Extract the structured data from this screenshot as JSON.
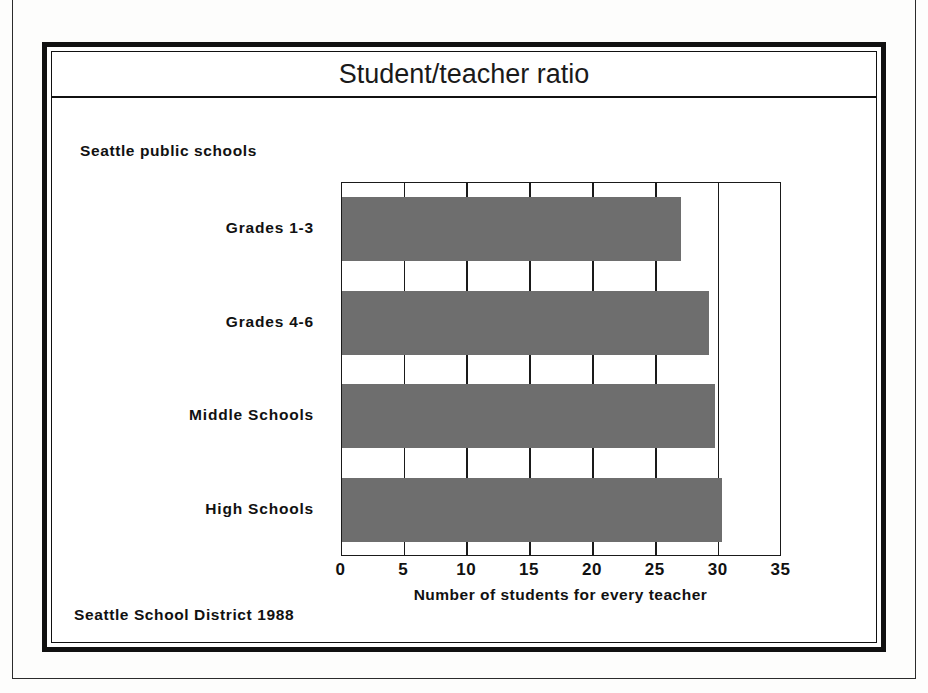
{
  "figure": {
    "title": "Student/teacher ratio",
    "subtitle": "Seattle public schools",
    "source_note": "Seattle School District 1988"
  },
  "chart_data": {
    "type": "bar",
    "orientation": "horizontal",
    "title": "Student/teacher ratio",
    "subtitle": "Seattle public schools",
    "categories": [
      "Grades 1-3",
      "Grades 4-6",
      "Middle Schools",
      "High Schools"
    ],
    "values": [
      27,
      29.2,
      29.7,
      30.3
    ],
    "xlabel": "Number of students for every teacher",
    "ylabel": "",
    "xlim": [
      0,
      35
    ],
    "xticks": [
      0,
      5,
      10,
      15,
      20,
      25,
      30,
      35
    ],
    "xtick_labels": [
      "0",
      "5",
      "10",
      "15",
      "20",
      "25",
      "30",
      "35"
    ],
    "grid": "vertical",
    "bar_color": "#6e6e6e",
    "axis_color": "#1a1a1a",
    "legend": "none",
    "source": "Seattle School District 1988"
  }
}
